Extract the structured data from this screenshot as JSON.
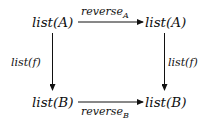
{
  "diagram": {
    "type": "commutative-square",
    "nodes": {
      "top_left": "list(A)",
      "top_right": "list(A)",
      "bottom_left": "list(B)",
      "bottom_right": "list(B)"
    },
    "arrows": {
      "top": {
        "label": "reverse",
        "subscript": "A",
        "from": "top_left",
        "to": "top_right"
      },
      "bottom": {
        "label": "reverse",
        "subscript": "B",
        "from": "bottom_left",
        "to": "bottom_right"
      },
      "left": {
        "label": "list(f)",
        "from": "top_left",
        "to": "bottom_left"
      },
      "right": {
        "label": "list(f)",
        "from": "top_right",
        "to": "bottom_right"
      }
    },
    "colors": {
      "ink": "#111111",
      "background": "#ffffff"
    }
  }
}
